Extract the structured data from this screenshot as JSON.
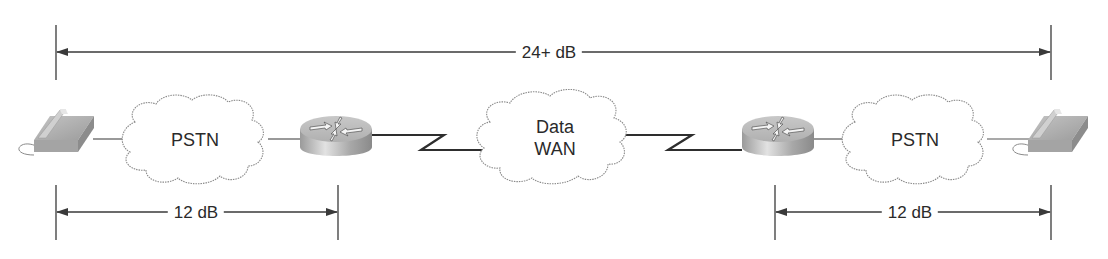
{
  "figure": {
    "type": "network-loss-diagram",
    "colors": {
      "line": "#3a3a3a",
      "cloud_outline": "#8a8a8a",
      "device_gray": "#b8b8b8",
      "text": "#2a2a2a",
      "background": "#ffffff"
    }
  },
  "dimensions": {
    "end_to_end": {
      "label": "24+ dB"
    },
    "left_segment": {
      "label": "12 dB"
    },
    "right_segment": {
      "label": "12 dB"
    }
  },
  "nodes": [
    {
      "id": "phone-left",
      "kind": "telephone-icon"
    },
    {
      "id": "pstn-left",
      "kind": "cloud",
      "label": "PSTN"
    },
    {
      "id": "router-left",
      "kind": "router-icon"
    },
    {
      "id": "data-wan",
      "kind": "cloud",
      "label_line1": "Data",
      "label_line2": "WAN"
    },
    {
      "id": "router-right",
      "kind": "router-icon"
    },
    {
      "id": "pstn-right",
      "kind": "cloud",
      "label": "PSTN"
    },
    {
      "id": "phone-right",
      "kind": "telephone-icon"
    }
  ],
  "links": [
    {
      "from": "phone-left",
      "to": "pstn-left",
      "style": "straight"
    },
    {
      "from": "pstn-left",
      "to": "router-left",
      "style": "straight"
    },
    {
      "from": "router-left",
      "to": "data-wan",
      "style": "serial-zigzag"
    },
    {
      "from": "data-wan",
      "to": "router-right",
      "style": "serial-zigzag"
    },
    {
      "from": "router-right",
      "to": "pstn-right",
      "style": "straight"
    },
    {
      "from": "pstn-right",
      "to": "phone-right",
      "style": "straight"
    }
  ]
}
